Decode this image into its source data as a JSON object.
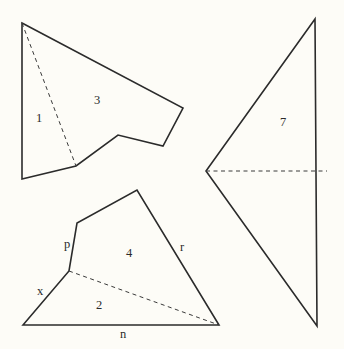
{
  "figure": {
    "type": "geometric dissection diagram",
    "shapes": [
      {
        "id": "upper-left-polygon",
        "regions": [
          {
            "id": "region-1",
            "label": "1"
          },
          {
            "id": "region-3",
            "label": "3"
          }
        ],
        "has_dashed_diagonal": true
      },
      {
        "id": "lower-left-polygon",
        "regions": [
          {
            "id": "region-4",
            "label": "4"
          },
          {
            "id": "region-2",
            "label": "2"
          }
        ],
        "side_labels": [
          {
            "id": "side-p",
            "label": "p"
          },
          {
            "id": "side-x",
            "label": "x"
          },
          {
            "id": "side-n",
            "label": "n"
          },
          {
            "id": "side-r",
            "label": "r"
          }
        ],
        "has_dashed_diagonal": true
      },
      {
        "id": "right-triangle",
        "regions": [
          {
            "id": "region-7",
            "label": "7"
          }
        ],
        "has_dashed_horizontal": true
      }
    ]
  },
  "labels": {
    "region_1": "1",
    "region_3": "3",
    "region_4": "4",
    "region_2": "2",
    "region_7": "7",
    "side_p": "p",
    "side_x": "x",
    "side_n": "n",
    "side_r": "r"
  }
}
